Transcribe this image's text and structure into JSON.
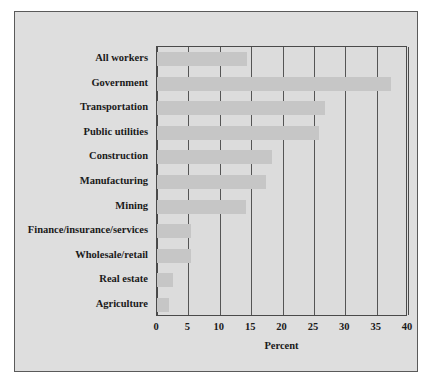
{
  "chart_data": {
    "type": "bar",
    "orientation": "horizontal",
    "title": "",
    "xlabel": "Percent",
    "ylabel": "",
    "xlim": [
      0,
      40
    ],
    "xticks": [
      0,
      5,
      10,
      15,
      20,
      25,
      30,
      35,
      40
    ],
    "grid": true,
    "legend": false,
    "categories": [
      "All workers",
      "Government",
      "Transportation",
      "Public utilities",
      "Construction",
      "Manufacturing",
      "Mining",
      "Finance/insurance/services",
      "Wholesale/retail",
      "Real estate",
      "Agriculture"
    ],
    "values": [
      14.3,
      37.3,
      26.7,
      25.8,
      18.4,
      17.3,
      14.2,
      5.4,
      5.4,
      2.5,
      1.9
    ]
  },
  "style": {
    "bar_color": "#c6c6c6",
    "plot_background": "#dcdcdc",
    "figure_background": "#dedede",
    "axis_color": "#4a4a4a",
    "grid_color": "#555555",
    "text_color": "#1a1a1a"
  }
}
